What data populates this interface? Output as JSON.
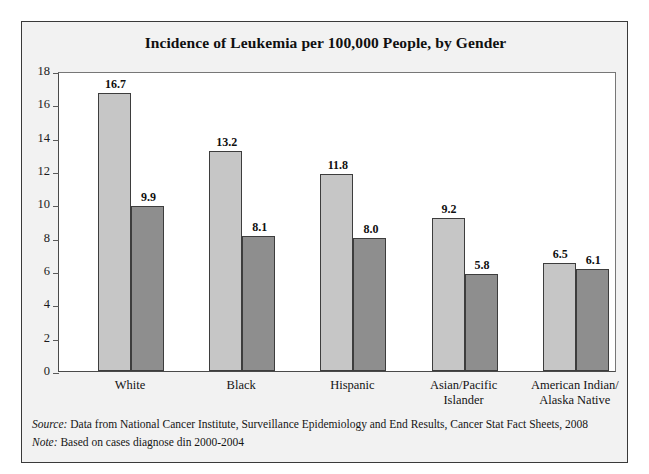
{
  "chart_data": {
    "type": "bar",
    "title": "Incidence of Leukemia per 100,000 People, by Gender",
    "xlabel": "",
    "ylabel": "",
    "ylim": [
      0,
      18
    ],
    "yticks": [
      0,
      2,
      4,
      6,
      8,
      10,
      12,
      14,
      16,
      18
    ],
    "ytick_labels": [
      "0",
      "2",
      "4",
      "6",
      "8",
      "10",
      "12",
      "14",
      "16",
      "18"
    ],
    "grid": false,
    "legend_position": "top-right",
    "categories": [
      "White",
      "Black",
      "Hispanic",
      "Asian/Pacific Islander",
      "American Indian/Alaska Native"
    ],
    "category_label_lines": [
      [
        "White"
      ],
      [
        "Black"
      ],
      [
        "Hispanic"
      ],
      [
        "Asian/Pacific",
        "Islander"
      ],
      [
        "American Indian/",
        "Alaska Native"
      ]
    ],
    "series": [
      {
        "name": "Men",
        "color": "#c6c6c6",
        "values": [
          16.7,
          13.2,
          11.8,
          9.2,
          6.5
        ],
        "value_labels": [
          "16.7",
          "13.2",
          "11.8",
          "9.2",
          "6.5"
        ]
      },
      {
        "name": "Women",
        "color": "#8e8e8e",
        "values": [
          9.9,
          8.1,
          8.0,
          5.8,
          6.1
        ],
        "value_labels": [
          "9.9",
          "8.1",
          "8.0",
          "5.8",
          "6.1"
        ]
      }
    ]
  },
  "legend": {
    "items": [
      {
        "label": "Men",
        "swatch": "men"
      },
      {
        "label": "Women",
        "swatch": "women"
      }
    ]
  },
  "footnotes": [
    {
      "key": "Source:",
      "text": " Data from National Cancer Institute, Surveillance Epidemiology and End Results, Cancer Stat Fact Sheets, 2008"
    },
    {
      "key": "Note:",
      "text": " Based on cases diagnose din 2000-2004"
    }
  ],
  "colors": {
    "men_bar": "#c6c6c6",
    "women_bar": "#8e8e8e",
    "bar_outline": "#3d3d3d",
    "frame_border": "#3a3a3a",
    "frame_background": "#f2f2f2",
    "plot_background": "#ffffff",
    "text": "#101010"
  }
}
